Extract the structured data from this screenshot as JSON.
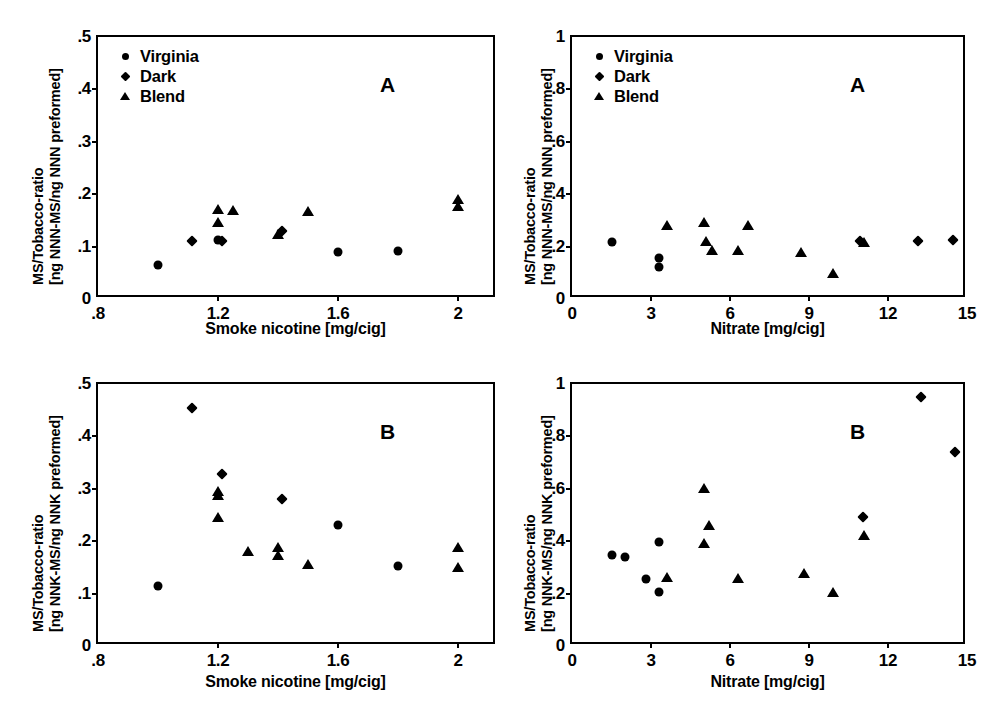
{
  "figure": {
    "legend_entries": [
      {
        "label": "Virginia",
        "marker": "circle-marker-icon"
      },
      {
        "label": "Dark",
        "marker": "diamond-marker-icon"
      },
      {
        "label": "Blend",
        "marker": "triangle-marker-icon"
      }
    ]
  },
  "chart_data": [
    {
      "id": "panel-A-nicotine-NNN",
      "type": "scatter",
      "panel_letter": "A",
      "title": "",
      "xlabel": "Smoke nicotine [mg/cig]",
      "ylabel_line1": "MS/Tobacco-ratio",
      "ylabel_line2": "[ng NNN-MS/ng NNN preformed]",
      "xlim": [
        0.8,
        2.13
      ],
      "ylim": [
        0,
        0.5
      ],
      "xticks": [
        0.8,
        1.2,
        1.6,
        2.0
      ],
      "xticklabels": [
        ".8",
        "1.2",
        "1.6",
        "2"
      ],
      "yticks": [
        0,
        0.1,
        0.2,
        0.3,
        0.4,
        0.5
      ],
      "yticklabels": [
        "0",
        ".1",
        ".2",
        ".3",
        ".4",
        ".5"
      ],
      "grid": false,
      "legend_position": "top-left",
      "series": [
        {
          "name": "Virginia",
          "marker": "circle",
          "points": [
            [
              1.0,
              0.065
            ],
            [
              1.2,
              0.112
            ],
            [
              1.6,
              0.09
            ],
            [
              1.8,
              0.092
            ]
          ]
        },
        {
          "name": "Dark",
          "marker": "diamond",
          "points": [
            [
              1.1,
              0.118
            ],
            [
              1.2,
              0.118
            ],
            [
              1.4,
              0.137
            ]
          ]
        },
        {
          "name": "Blend",
          "marker": "triangle",
          "points": [
            [
              1.2,
              0.171
            ],
            [
              1.2,
              0.147
            ],
            [
              1.25,
              0.169
            ],
            [
              1.4,
              0.124
            ],
            [
              1.5,
              0.167
            ],
            [
              2.0,
              0.191
            ],
            [
              2.0,
              0.178
            ]
          ]
        }
      ]
    },
    {
      "id": "panel-A-nitrate-NNN",
      "type": "scatter",
      "panel_letter": "A",
      "title": "",
      "xlabel": "Nitrate [mg/cig]",
      "ylabel_line1": "MS/Tobacco-ratio",
      "ylabel_line2": "[ng NNN-MS/ng NNN preformed]",
      "xlim": [
        0,
        15
      ],
      "ylim": [
        0,
        1
      ],
      "xticks": [
        0,
        3,
        6,
        9,
        12,
        15
      ],
      "xticklabels": [
        "0",
        "3",
        "6",
        "9",
        "12",
        "15"
      ],
      "yticks": [
        0,
        0.2,
        0.4,
        0.6,
        0.8,
        1.0
      ],
      "yticklabels": [
        "0",
        ".2",
        ".4",
        ".6",
        ".8",
        "1"
      ],
      "grid": false,
      "legend_position": "top-left",
      "series": [
        {
          "name": "Virginia",
          "marker": "circle",
          "points": [
            [
              1.5,
              0.218
            ],
            [
              3.3,
              0.158
            ],
            [
              3.3,
              0.122
            ]
          ]
        },
        {
          "name": "Dark",
          "marker": "diamond",
          "points": [
            [
              10.8,
              0.235
            ],
            [
              13.0,
              0.235
            ],
            [
              14.3,
              0.242
            ]
          ]
        },
        {
          "name": "Blend",
          "marker": "triangle",
          "points": [
            [
              3.6,
              0.283
            ],
            [
              5.0,
              0.293
            ],
            [
              5.1,
              0.222
            ],
            [
              5.3,
              0.186
            ],
            [
              6.3,
              0.188
            ],
            [
              6.7,
              0.283
            ],
            [
              8.7,
              0.181
            ],
            [
              9.9,
              0.098
            ],
            [
              11.1,
              0.219
            ]
          ]
        }
      ]
    },
    {
      "id": "panel-B-nicotine-NNK",
      "type": "scatter",
      "panel_letter": "B",
      "title": "",
      "xlabel": "Smoke nicotine [mg/cig]",
      "ylabel_line1": "MS/Tobacco-ratio",
      "ylabel_line2": "[ng NNK-MS/ng NNK preformed]",
      "xlim": [
        0.8,
        2.13
      ],
      "ylim": [
        0,
        0.5
      ],
      "xticks": [
        0.8,
        1.2,
        1.6,
        2.0
      ],
      "xticklabels": [
        ".8",
        "1.2",
        "1.6",
        "2"
      ],
      "yticks": [
        0,
        0.1,
        0.2,
        0.3,
        0.4,
        0.5
      ],
      "yticklabels": [
        "0",
        ".1",
        ".2",
        ".3",
        ".4",
        ".5"
      ],
      "grid": false,
      "legend_position": "none",
      "series": [
        {
          "name": "Virginia",
          "marker": "circle",
          "points": [
            [
              1.0,
              0.115
            ],
            [
              1.6,
              0.231
            ],
            [
              1.8,
              0.152
            ]
          ]
        },
        {
          "name": "Dark",
          "marker": "diamond",
          "points": [
            [
              1.1,
              0.461
            ],
            [
              1.2,
              0.336
            ],
            [
              1.4,
              0.289
            ]
          ]
        },
        {
          "name": "Blend",
          "marker": "triangle",
          "points": [
            [
              1.2,
              0.296
            ],
            [
              1.2,
              0.288
            ],
            [
              1.2,
              0.247
            ],
            [
              1.3,
              0.181
            ],
            [
              1.4,
              0.189
            ],
            [
              1.4,
              0.173
            ],
            [
              1.5,
              0.156
            ],
            [
              2.0,
              0.189
            ],
            [
              2.0,
              0.15
            ]
          ]
        }
      ]
    },
    {
      "id": "panel-B-nitrate-NNK",
      "type": "scatter",
      "panel_letter": "B",
      "title": "",
      "xlabel": "Nitrate [mg/cig]",
      "ylabel_line1": "MS/Tobacco-ratio",
      "ylabel_line2": "[ng NNK-MS/ng NNK preformed]",
      "xlim": [
        0,
        15
      ],
      "ylim": [
        0,
        1
      ],
      "xticks": [
        0,
        3,
        6,
        9,
        12,
        15
      ],
      "xticklabels": [
        "0",
        "3",
        "6",
        "9",
        "12",
        "15"
      ],
      "yticks": [
        0,
        0.2,
        0.4,
        0.6,
        0.8,
        1.0
      ],
      "yticklabels": [
        "0",
        ".2",
        ".4",
        ".6",
        ".8",
        "1"
      ],
      "grid": false,
      "legend_position": "none",
      "series": [
        {
          "name": "Virginia",
          "marker": "circle",
          "points": [
            [
              1.5,
              0.348
            ],
            [
              2.0,
              0.341
            ],
            [
              2.8,
              0.255
            ],
            [
              3.3,
              0.396
            ],
            [
              3.3,
              0.205
            ]
          ]
        },
        {
          "name": "Dark",
          "marker": "diamond",
          "points": [
            [
              10.9,
              0.508
            ],
            [
              13.1,
              0.966
            ],
            [
              14.4,
              0.754
            ]
          ]
        },
        {
          "name": "Blend",
          "marker": "triangle",
          "points": [
            [
              3.6,
              0.262
            ],
            [
              5.0,
              0.602
            ],
            [
              5.0,
              0.392
            ],
            [
              5.2,
              0.46
            ],
            [
              6.3,
              0.258
            ],
            [
              8.8,
              0.277
            ],
            [
              9.9,
              0.205
            ],
            [
              11.1,
              0.424
            ]
          ]
        }
      ]
    }
  ]
}
